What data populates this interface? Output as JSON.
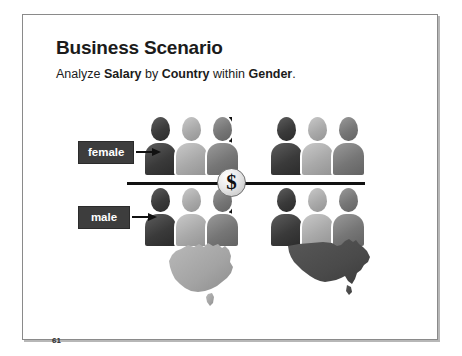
{
  "slide": {
    "title": "Business Scenario",
    "subtitle": {
      "part1": "Analyze ",
      "measure": "Salary",
      "part2": " by ",
      "dimension": "Country",
      "part3": " within ",
      "grouping": "Gender",
      "part4": ".",
      "full_text": "Analyze Salary by Country within Gender."
    },
    "page_number": "61"
  },
  "diagram": {
    "center_icon": {
      "name": "dollar-sign-badge",
      "glyph": "$",
      "meaning": "Salary"
    },
    "row_labels": [
      {
        "id": "female",
        "label": "female",
        "arrow": "right-arrow"
      },
      {
        "id": "male",
        "label": "male",
        "arrow": "right-arrow"
      }
    ],
    "quadrants": [
      {
        "id": "female-australia",
        "row": "female",
        "column": "australia",
        "people_count": 3,
        "people_shades": [
          "dark",
          "light",
          "mid"
        ]
      },
      {
        "id": "female-usa",
        "row": "female",
        "column": "usa",
        "people_count": 3,
        "people_shades": [
          "dark",
          "light",
          "mid"
        ]
      },
      {
        "id": "male-australia",
        "row": "male",
        "column": "australia",
        "people_count": 3,
        "people_shades": [
          "dark",
          "light",
          "mid"
        ]
      },
      {
        "id": "male-usa",
        "row": "male",
        "column": "usa",
        "people_count": 3,
        "people_shades": [
          "dark",
          "light",
          "mid"
        ]
      }
    ],
    "country_maps": [
      {
        "id": "australia",
        "name": "australia-map",
        "shade": "light-gray",
        "color": "#a3a3a3"
      },
      {
        "id": "usa",
        "name": "usa-map",
        "shade": "dark-gray",
        "color": "#4a4a4a"
      }
    ]
  },
  "colors": {
    "frame_border": "#8a8a8a",
    "label_box_fill": "#3d3d3d",
    "label_box_text": "#ffffff",
    "axis_line": "#111111",
    "text": "#1b1b1b",
    "background": "#ffffff"
  }
}
